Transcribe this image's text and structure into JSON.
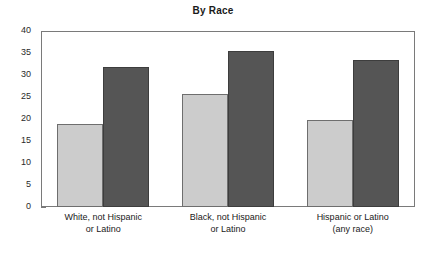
{
  "chart_data": {
    "type": "bar",
    "title": "By Race",
    "xlabel": "",
    "ylabel": "",
    "ylim": [
      0,
      40
    ],
    "ytick_step": 5,
    "yticks": [
      "40",
      "35",
      "30",
      "25",
      "20",
      "15",
      "10",
      "5",
      "0"
    ],
    "grid": false,
    "legend": "none",
    "categories": [
      "White, not Hispanic or Latino",
      "Black, not Hispanic or Latino",
      "Hispanic or Latino (any race)"
    ],
    "category_lines": [
      [
        "White, not Hispanic",
        "or Latino"
      ],
      [
        "Black, not Hispanic",
        "or Latino"
      ],
      [
        "Hispanic or Latino",
        "(any race)"
      ]
    ],
    "series": [
      {
        "name": "light-series",
        "color": "#cccccc",
        "values": [
          18.8,
          25.6,
          19.8
        ]
      },
      {
        "name": "dark-series",
        "color": "#555555",
        "values": [
          31.9,
          35.5,
          33.3
        ]
      }
    ]
  },
  "colors": {
    "light_bar": "#cccccc",
    "dark_bar": "#555555",
    "axis": "#7a7a7a",
    "text": "#1a1a1a",
    "background": "#ffffff"
  }
}
